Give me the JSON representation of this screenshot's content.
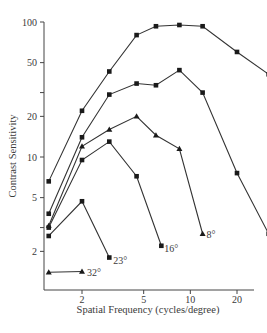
{
  "chart_data": {
    "type": "line",
    "title": "",
    "xlabel": "Spatial Frequency (cycles/degree)",
    "ylabel": "Contrast Sensitivity",
    "x_scale": "log",
    "y_scale": "log",
    "xlim": [
      1.1,
      40
    ],
    "ylim": [
      1.1,
      100
    ],
    "x_ticks": [
      2,
      5,
      10,
      20
    ],
    "y_ticks": [
      2,
      5,
      10,
      20,
      50,
      100
    ],
    "grid": false,
    "legend": "inline labels at line ends",
    "series": [
      {
        "name": "0°",
        "marker": "square",
        "x": [
          1.22,
          2.0,
          3.0,
          4.5,
          6.0,
          8.5,
          12.0,
          20.0,
          32.0
        ],
        "y": [
          6.6,
          22,
          43,
          80,
          93,
          95,
          93,
          60,
          41
        ]
      },
      {
        "name": "2°",
        "marker": "square",
        "x": [
          1.22,
          2.0,
          3.0,
          4.5,
          6.0,
          8.5,
          12.0,
          20.0,
          32.0
        ],
        "y": [
          3.8,
          14,
          29,
          35,
          34,
          44,
          30,
          7.6,
          2.7
        ]
      },
      {
        "name": "8°",
        "marker": "triangle",
        "x": [
          1.22,
          2.0,
          3.0,
          4.5,
          6.0,
          8.5,
          12.0
        ],
        "y": [
          3.1,
          12,
          16,
          20,
          14.5,
          11.5,
          2.7
        ]
      },
      {
        "name": "16°",
        "marker": "square",
        "x": [
          1.22,
          2.0,
          3.0,
          4.5,
          6.5
        ],
        "y": [
          3.0,
          9.5,
          13,
          7.2,
          2.2
        ]
      },
      {
        "name": "23°",
        "marker": "square",
        "x": [
          1.22,
          2.0,
          3.0
        ],
        "y": [
          2.6,
          4.7,
          1.8
        ]
      },
      {
        "name": "32°",
        "marker": "triangle",
        "x": [
          1.22,
          2.0
        ],
        "y": [
          1.4,
          1.42
        ]
      }
    ]
  },
  "labels": {
    "xlabel": "Spatial Frequency (cycles/degree)",
    "ylabel": "Contrast Sensitivity",
    "x_ticks": [
      "2",
      "5",
      "10",
      "20"
    ],
    "y_ticks": [
      "100",
      "50",
      "20",
      "10",
      "5",
      "2"
    ],
    "series_labels": [
      "0°",
      "2°",
      "8°",
      "16°",
      "23°",
      "32°"
    ]
  }
}
